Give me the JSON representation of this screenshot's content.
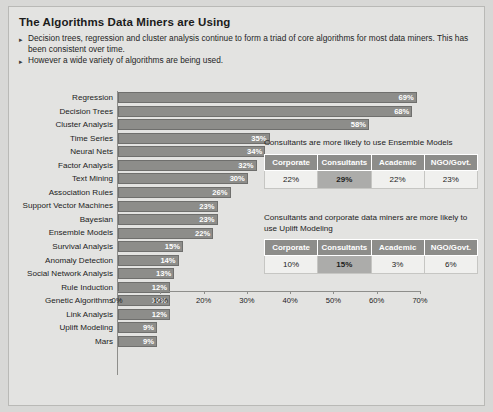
{
  "slide": {
    "title": "The Algorithms Data Miners are Using",
    "bullet_marker": "▸",
    "bullets": [
      "Decision trees, regression and cluster analysis continue to form a triad of core algorithms for most data miners. This has been consistent over time.",
      "However a wide variety of algorithms are being used."
    ]
  },
  "chart_data": {
    "type": "bar",
    "orientation": "horizontal",
    "title": "The Algorithms Data Miners are Using",
    "xlabel": "",
    "ylabel": "",
    "xlim": [
      0,
      70
    ],
    "grid": false,
    "legend": "none",
    "value_suffix": "%",
    "xticks": [
      "0%",
      "10%",
      "20%",
      "30%",
      "40%",
      "50%",
      "60%",
      "70%"
    ],
    "xtick_values": [
      0,
      10,
      20,
      30,
      40,
      50,
      60,
      70
    ],
    "categories": [
      "Regression",
      "Decision Trees",
      "Cluster Analysis",
      "Time Series",
      "Neural Nets",
      "Factor Analysis",
      "Text Mining",
      "Association Rules",
      "Support Vector Machines",
      "Bayesian",
      "Ensemble Models",
      "Survival Analysis",
      "Anomaly Detection",
      "Social Network Analysis",
      "Rule Induction",
      "Genetic Algorithms",
      "Link Analysis",
      "Uplift Modeling",
      "Mars"
    ],
    "values": [
      69,
      68,
      58,
      35,
      34,
      32,
      30,
      26,
      23,
      23,
      22,
      15,
      14,
      13,
      12,
      12,
      12,
      9,
      9
    ],
    "data_labels": [
      "69%",
      "68%",
      "58%",
      "35%",
      "34%",
      "32%",
      "30%",
      "26%",
      "23%",
      "23%",
      "22%",
      "15%",
      "14%",
      "13%",
      "12%",
      "12%",
      "12%",
      "9%",
      "9%"
    ]
  },
  "insets": [
    {
      "caption": "Consultants are more likely to use Ensemble Models",
      "headers": [
        "Corporate",
        "Consultants",
        "Academic",
        "NGO/Govt."
      ],
      "values": [
        "22%",
        "29%",
        "22%",
        "23%"
      ],
      "highlight_index": 1
    },
    {
      "caption": "Consultants and corporate data miners are more likely to use Uplift Modeling",
      "headers": [
        "Corporate",
        "Consultants",
        "Academic",
        "NGO/Govt."
      ],
      "values": [
        "10%",
        "15%",
        "3%",
        "6%"
      ],
      "highlight_index": 1
    }
  ],
  "colors": {
    "bar_fill": "#8d8d8a",
    "bar_border": "#6f6f6d",
    "panel_bg": "#e3e3e1",
    "table_header_bg": "#8d8d8a",
    "table_highlight_bg": "#acacaa",
    "axis": "#8e8e8b"
  }
}
